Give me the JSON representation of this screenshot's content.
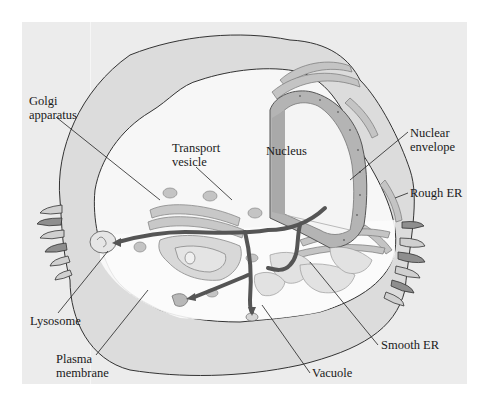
{
  "figure": {
    "type": "cell-diagram",
    "colors": {
      "background": "#ffffff",
      "panel": "#ececec",
      "membrane_fill": "#dcdcdc",
      "cytoplasm": "#f7f7f7",
      "organelle_fill": "#c8c8c8",
      "organelle_dark": "#8e8e8e",
      "pathway_arrow": "#555555",
      "outline": "#333333",
      "label_text": "#1a1a1a"
    }
  },
  "labels": {
    "golgi": {
      "line1": "Golgi",
      "line2": "apparatus"
    },
    "transport_vesicle": {
      "line1": "Transport",
      "line2": "vesicle"
    },
    "nucleus": {
      "line1": "Nucleus"
    },
    "nuclear_envelope": {
      "line1": "Nuclear",
      "line2": "envelope"
    },
    "rough_er": {
      "line1": "Rough ER"
    },
    "lysosome": {
      "line1": "Lysosome"
    },
    "plasma_membrane": {
      "line1": "Plasma",
      "line2": "membrane"
    },
    "smooth_er": {
      "line1": "Smooth ER"
    },
    "vacuole": {
      "line1": "Vacuole"
    }
  }
}
